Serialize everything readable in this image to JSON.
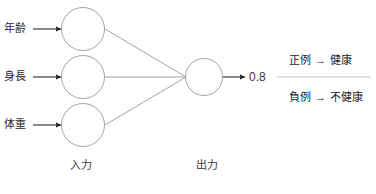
{
  "diagram": {
    "input_labels": [
      {
        "text": "年齢"
      },
      {
        "text": "身長"
      },
      {
        "text": "体重"
      }
    ],
    "layer_captions": {
      "input": "入力",
      "output": "出力"
    },
    "output_value": "0.8",
    "outcomes": [
      {
        "condition": "正例",
        "arrow": "→",
        "result": "健康"
      },
      {
        "condition": "負例",
        "arrow": "→",
        "result": "不健康"
      }
    ],
    "colors": {
      "node_stroke": "#9a9a9a",
      "edge": "#8d8d8d",
      "arrow": "#2b2b2b",
      "divider": "#b5b5b5",
      "text": "#2b2b2b",
      "background": "#ffffff"
    }
  }
}
